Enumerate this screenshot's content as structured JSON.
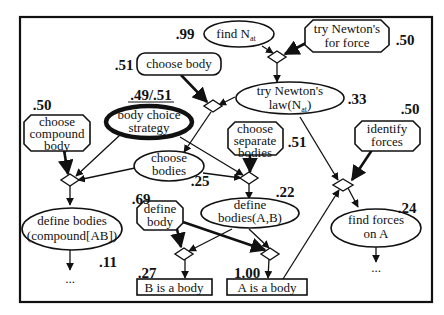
{
  "diagram": {
    "type": "bayesian-solution-graph",
    "nodes": {
      "find_nat": {
        "text": "find N",
        "sub": "at",
        "prob": ".99"
      },
      "try_newton_force": {
        "line1": "try Newton's",
        "line2": "for force",
        "prob": ".50"
      },
      "try_newton_law": {
        "line1": "try Newton's",
        "line2": "law(N",
        "sub": "at",
        "close": ")",
        "prob": ".33"
      },
      "choose_body": {
        "text": "choose body",
        "prob": ".51"
      },
      "body_choice_strategy": {
        "line1": "body choice",
        "line2": "strategy",
        "prob": ".49/.51"
      },
      "choose_compound_body": {
        "line1": "choose",
        "line2": "compound",
        "line3": "body",
        "prob": ".50"
      },
      "choose_separate_bodies": {
        "line1": "choose",
        "line2": "separate",
        "line3": "bodies",
        "prob": ".51"
      },
      "choose_bodies": {
        "line1": "choose",
        "line2": "bodies",
        "prob": ".25"
      },
      "identify_forces": {
        "line1": "identify",
        "line2": "forces",
        "prob": ".50"
      },
      "define_bodies_ab": {
        "line1": "define",
        "line2": "bodies(A,B)",
        "prob": ".22"
      },
      "find_forces_on_a": {
        "line1": "find forces",
        "line2": "on A",
        "prob": ".24"
      },
      "define_body": {
        "line1": "define",
        "line2": "body",
        "prob": ".69"
      },
      "define_bodies_compound": {
        "line1": "define bodies",
        "line2": "(compound[AB])",
        "prob": ".11"
      },
      "b_is_a_body": {
        "text": "B is a body",
        "prob": ".27"
      },
      "a_is_a_body": {
        "text": "A is a body",
        "prob": "1.00"
      }
    },
    "ellipsis": "..."
  }
}
